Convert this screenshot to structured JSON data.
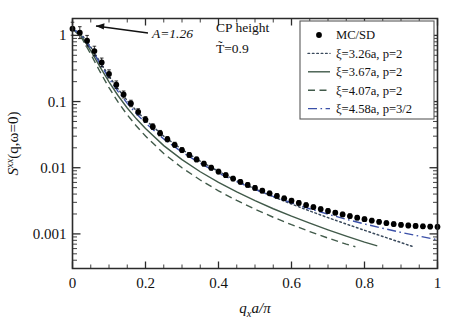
{
  "figure": {
    "name": "structure-factor-plot",
    "xlabel_main": "q",
    "xlabel_sub": "x",
    "xlabel_rest": "a/π",
    "ylabel": "S",
    "ylabel_sup": "xx",
    "ylabel_rest": "(q,ω=0)"
  },
  "annotations": {
    "amplitude": "A=1.26",
    "cp_height": "CP height",
    "temperature": "T̃=0.9"
  },
  "legend": {
    "items": [
      {
        "label": "MC/SD",
        "style": "marker",
        "color": "#000000"
      },
      {
        "label": "ξ=3.26a, p=2",
        "style": "dotted",
        "color": "#3a4a5c"
      },
      {
        "label": "ξ=3.67a, p=2",
        "style": "solid",
        "color": "#415a4a"
      },
      {
        "label": "ξ=4.07a, p=2",
        "style": "dashed",
        "color": "#415a4a"
      },
      {
        "label": "ξ=4.58a, p=3/2",
        "style": "dashdot",
        "color": "#3b50a8"
      }
    ]
  },
  "chart_data": {
    "type": "line",
    "title": "",
    "xlabel": "q_x a/π",
    "ylabel": "S^xx(q, ω=0)",
    "xlim": [
      0,
      1
    ],
    "ylim": [
      0.0003,
      1.8
    ],
    "yscale": "log",
    "xscale": "linear",
    "grid": false,
    "legend_position": "top-right",
    "xticks": [
      0,
      0.2,
      0.4,
      0.6,
      0.8,
      1
    ],
    "xticklabels": [
      "0",
      "0.2",
      "0.4",
      "0.6",
      "0.8",
      "1"
    ],
    "yticks": [
      1,
      0.1,
      0.01,
      0.001
    ],
    "yticklabels": [
      "1",
      "0.1",
      "0.01",
      "0.001"
    ],
    "amplitude_A": 1.26,
    "series": [
      {
        "name": "MC/SD",
        "type": "scatter",
        "marker": "filled-circle",
        "color": "#000000",
        "has_errorbars": true,
        "x": [
          0.0,
          0.02,
          0.04,
          0.06,
          0.08,
          0.1,
          0.12,
          0.14,
          0.16,
          0.18,
          0.2,
          0.22,
          0.24,
          0.26,
          0.28,
          0.3,
          0.32,
          0.34,
          0.36,
          0.38,
          0.4,
          0.42,
          0.44,
          0.46,
          0.48,
          0.5,
          0.52,
          0.54,
          0.56,
          0.58,
          0.6,
          0.62,
          0.64,
          0.66,
          0.68,
          0.7,
          0.72,
          0.74,
          0.76,
          0.78,
          0.8,
          0.82,
          0.84,
          0.86,
          0.88,
          0.9,
          0.92,
          0.94,
          0.96,
          0.98,
          1.0
        ],
        "y": [
          1.26,
          1.1,
          0.83,
          0.58,
          0.39,
          0.262,
          0.18,
          0.128,
          0.0935,
          0.07,
          0.0535,
          0.0418,
          0.0333,
          0.027,
          0.0222,
          0.0185,
          0.0156,
          0.01335,
          0.0115,
          0.01,
          0.00875,
          0.00772,
          0.00685,
          0.00612,
          0.0055,
          0.00496,
          0.0045,
          0.0041,
          0.00375,
          0.00345,
          0.00318,
          0.00294,
          0.00273,
          0.00254,
          0.00237,
          0.00222,
          0.00209,
          0.00197,
          0.00186,
          0.00176,
          0.00167,
          0.00159,
          0.00152,
          0.00146,
          0.00141,
          0.00137,
          0.00134,
          0.00132,
          0.0013,
          0.00129,
          0.00128
        ]
      },
      {
        "name": "ξ=3.26a, p=2",
        "type": "line",
        "style": "dotted",
        "color": "#3a4a5c",
        "xi": 3.26,
        "p": 2,
        "x": [
          0.0,
          0.025,
          0.05,
          0.075,
          0.1,
          0.125,
          0.15,
          0.175,
          0.2,
          0.25,
          0.3,
          0.35,
          0.4,
          0.45,
          0.5,
          0.55,
          0.6,
          0.65,
          0.7,
          0.75,
          0.8,
          0.85,
          0.9,
          0.93
        ],
        "y": [
          1.26,
          1.03,
          0.665,
          0.4,
          0.242,
          0.1545,
          0.1035,
          0.0725,
          0.0527,
          0.03,
          0.0188,
          0.01255,
          0.0088,
          0.0064,
          0.00478,
          0.00365,
          0.00283,
          0.00222,
          0.00176,
          0.00141,
          0.001135,
          0.000915,
          0.00074,
          0.00065
        ]
      },
      {
        "name": "ξ=3.67a, p=2",
        "type": "line",
        "style": "solid",
        "color": "#415a4a",
        "xi": 3.67,
        "p": 2,
        "x": [
          0.0,
          0.025,
          0.05,
          0.075,
          0.1,
          0.125,
          0.15,
          0.175,
          0.2,
          0.25,
          0.3,
          0.35,
          0.4,
          0.45,
          0.5,
          0.55,
          0.6,
          0.65,
          0.7,
          0.75,
          0.8,
          0.835
        ],
        "y": [
          1.26,
          0.975,
          0.59,
          0.338,
          0.198,
          0.1225,
          0.08,
          0.0548,
          0.0391,
          0.0216,
          0.01325,
          0.0087,
          0.006,
          0.0043,
          0.00318,
          0.0024,
          0.00185,
          0.00145,
          0.00115,
          0.000925,
          0.000752,
          0.00066
        ]
      },
      {
        "name": "ξ=4.07a, p=2",
        "type": "line",
        "style": "dashed",
        "color": "#415a4a",
        "xi": 4.07,
        "p": 2,
        "x": [
          0.0,
          0.025,
          0.05,
          0.075,
          0.1,
          0.125,
          0.15,
          0.175,
          0.2,
          0.25,
          0.3,
          0.35,
          0.4,
          0.45,
          0.5,
          0.55,
          0.6,
          0.65,
          0.7,
          0.75,
          0.775
        ],
        "y": [
          1.26,
          0.92,
          0.52,
          0.285,
          0.162,
          0.098,
          0.063,
          0.0426,
          0.0301,
          0.0164,
          0.00998,
          0.00652,
          0.00448,
          0.0032,
          0.00236,
          0.001785,
          0.00138,
          0.001085,
          0.000865,
          0.0007,
          0.00064
        ]
      },
      {
        "name": "ξ=4.58a, p=3/2",
        "type": "line",
        "style": "dashdot",
        "color": "#3b50a8",
        "xi": 4.58,
        "p": 1.5,
        "x": [
          0.0,
          0.025,
          0.05,
          0.075,
          0.1,
          0.125,
          0.15,
          0.175,
          0.2,
          0.25,
          0.3,
          0.35,
          0.4,
          0.45,
          0.5,
          0.55,
          0.6,
          0.65,
          0.7,
          0.75,
          0.8,
          0.85,
          0.9,
          0.95,
          1.0
        ],
        "y": [
          1.26,
          1.01,
          0.64,
          0.378,
          0.224,
          0.141,
          0.094,
          0.0655,
          0.0474,
          0.0272,
          0.0172,
          0.01165,
          0.0083,
          0.00615,
          0.0047,
          0.00368,
          0.002945,
          0.0024,
          0.001985,
          0.001665,
          0.001415,
          0.001215,
          0.001055,
          0.000925,
          0.000815
        ]
      }
    ]
  }
}
